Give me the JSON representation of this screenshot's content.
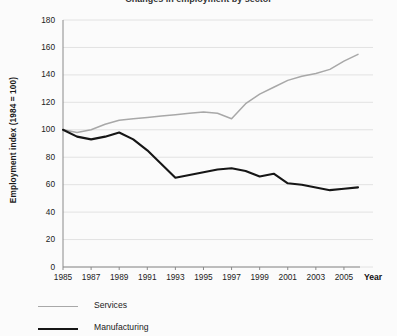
{
  "chart_data": {
    "type": "line",
    "title": "Changes in employment by sector",
    "xlabel": "Year",
    "ylabel": "Employment index (1984 = 100)",
    "xlim": [
      1985,
      2006
    ],
    "ylim": [
      0,
      180
    ],
    "grid": true,
    "legend_position": "bottom-left",
    "yticks": [
      0,
      20,
      40,
      60,
      80,
      100,
      120,
      140,
      160,
      180
    ],
    "xticks": [
      1985,
      1987,
      1989,
      1991,
      1993,
      1995,
      1997,
      1999,
      2001,
      2003,
      2005
    ],
    "x": [
      1985,
      1986,
      1987,
      1988,
      1989,
      1990,
      1991,
      1992,
      1993,
      1994,
      1995,
      1996,
      1997,
      1998,
      1999,
      2000,
      2001,
      2002,
      2003,
      2004,
      2005,
      2006
    ],
    "series": [
      {
        "name": "Services",
        "color": "#a8a8a8",
        "values": [
          100,
          98,
          100,
          104,
          107,
          108,
          109,
          110,
          111,
          112,
          113,
          112,
          108,
          119,
          126,
          131,
          136,
          139,
          141,
          144,
          150,
          155
        ]
      },
      {
        "name": "Manufacturing",
        "color": "#161616",
        "values": [
          100,
          95,
          93,
          95,
          98,
          93,
          85,
          75,
          65,
          67,
          69,
          71,
          72,
          70,
          66,
          68,
          61,
          60,
          58,
          56,
          57,
          58
        ]
      }
    ]
  },
  "axis": {
    "y_title": "Employment index (1984 = 100)",
    "x_title": "Year",
    "y_tick_labels": [
      "180",
      "160",
      "140",
      "120",
      "100",
      "80",
      "60",
      "40",
      "20",
      "0"
    ],
    "x_tick_labels": [
      "1985",
      "1987",
      "1989",
      "1991",
      "1993",
      "1995",
      "1997",
      "1999",
      "2001",
      "2003",
      "2005"
    ]
  },
  "legend": {
    "items": [
      {
        "label": "Services",
        "color": "#a8a8a8"
      },
      {
        "label": "Manufacturing",
        "color": "#161616"
      }
    ]
  },
  "header": {
    "title": "Changes in employment by sector"
  },
  "colors": {
    "background": "#fbfbfb",
    "grid": "#e2e2e2",
    "axis": "#8a8a8a",
    "text": "#222222"
  }
}
